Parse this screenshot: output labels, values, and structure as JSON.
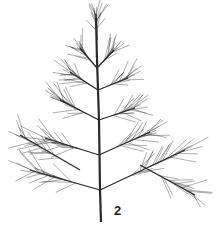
{
  "figure": {
    "label": "2",
    "label_pos": [
      114,
      203
    ],
    "ink_color": "#2a2a2a",
    "background": "#ffffff",
    "stem": [
      [
        101,
        222
      ],
      [
        100,
        190
      ],
      [
        99,
        120
      ],
      [
        97,
        60
      ],
      [
        96,
        18
      ]
    ],
    "branches": [
      {
        "from": [
          97,
          68
        ],
        "to": [
          80,
          48
        ],
        "needles": 14,
        "len": 22
      },
      {
        "from": [
          97,
          68
        ],
        "to": [
          114,
          50
        ],
        "needles": 14,
        "len": 22
      },
      {
        "from": [
          97,
          40
        ],
        "to": [
          96,
          14
        ],
        "needles": 16,
        "len": 20
      },
      {
        "from": [
          98,
          90
        ],
        "to": [
          70,
          72
        ],
        "needles": 16,
        "len": 24
      },
      {
        "from": [
          98,
          90
        ],
        "to": [
          128,
          78
        ],
        "needles": 16,
        "len": 24
      },
      {
        "from": [
          99,
          120
        ],
        "to": [
          60,
          100
        ],
        "needles": 18,
        "len": 26
      },
      {
        "from": [
          99,
          120
        ],
        "to": [
          135,
          108
        ],
        "needles": 18,
        "len": 26
      },
      {
        "from": [
          99,
          155
        ],
        "to": [
          45,
          138
        ],
        "needles": 20,
        "len": 28
      },
      {
        "from": [
          99,
          155
        ],
        "to": [
          150,
          132
        ],
        "needles": 20,
        "len": 28
      },
      {
        "from": [
          100,
          190
        ],
        "to": [
          30,
          170
        ],
        "needles": 22,
        "len": 30
      },
      {
        "from": [
          100,
          190
        ],
        "to": [
          185,
          150
        ],
        "needles": 22,
        "len": 30
      },
      {
        "from": [
          80,
          170
        ],
        "to": [
          20,
          135
        ],
        "needles": 16,
        "len": 26
      },
      {
        "from": [
          140,
          165
        ],
        "to": [
          195,
          195
        ],
        "needles": 16,
        "len": 26
      }
    ]
  }
}
